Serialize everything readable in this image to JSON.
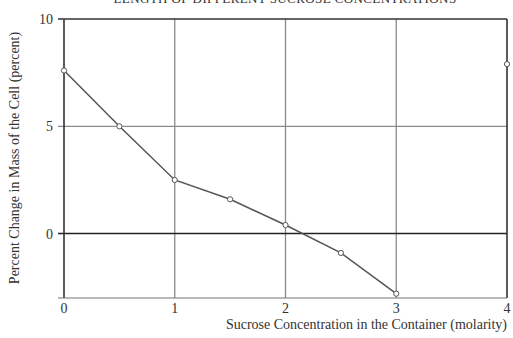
{
  "chart_data": {
    "type": "line",
    "title": "LENGTH OF DIFFERENT SUCROSE CONCENTRATIONS",
    "title_clipped": true,
    "xlabel": "Sucrose Concentration in the Container (molarity)",
    "ylabel": "Percent Change in Mass of the Cell (percent)",
    "xlim": [
      0,
      4
    ],
    "ylim": [
      -3,
      10
    ],
    "xticks": [
      0,
      1,
      2,
      3,
      4
    ],
    "yticks": [
      0,
      5,
      10
    ],
    "grid": true,
    "legend": null,
    "series": [
      {
        "name": "Percent change in mass",
        "x": [
          0,
          0.5,
          1,
          1.5,
          2,
          2.5,
          3
        ],
        "y": [
          7.6,
          5.0,
          2.5,
          1.6,
          0.4,
          -0.9,
          -2.8
        ],
        "connected": true,
        "marker": "open-circle"
      },
      {
        "name": "Isolated point",
        "x": [
          4
        ],
        "y": [
          7.9
        ],
        "connected": false,
        "marker": "open-circle"
      }
    ]
  },
  "axes": {
    "xtick_labels": [
      "0",
      "1",
      "2",
      "3",
      "4"
    ],
    "ytick_labels": [
      "0",
      "5",
      "10"
    ]
  },
  "colors": {
    "line": "#555555",
    "grid": "#8a8a8a",
    "axis": "#333333",
    "marker_fill": "#ffffff"
  }
}
